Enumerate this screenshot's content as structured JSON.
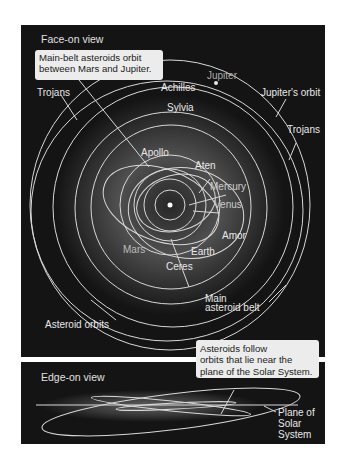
{
  "face_on": {
    "title": "Face-on view",
    "callout": [
      "Main-belt asteroids orbit",
      "between Mars and Jupiter."
    ],
    "labels": {
      "jupiter": "Jupiter",
      "achilles": "Achilles",
      "trojans_left": "Trojans",
      "jupiters_orbit": "Jupiter's orbit",
      "sylvia": "Sylvia",
      "trojans_right": "Trojans",
      "apollo": "Apollo",
      "aten": "Aten",
      "mercury": "Mercury",
      "venus": "Venus",
      "amor": "Amor",
      "mars": "Mars",
      "earth": "Earth",
      "ceres": "Ceres",
      "main_belt_1": "Main",
      "main_belt_2": "asteroid belt",
      "asteroid_orbits": "Asteroid orbits"
    }
  },
  "edge_on": {
    "title": "Edge-on view",
    "callout": [
      "Asteroids follow",
      "orbits that lie near the",
      "plane of the Solar System."
    ],
    "labels": {
      "plane_1": "Plane of",
      "plane_2": "Solar",
      "plane_3": "System"
    }
  },
  "colors": {
    "panel_bg": "#141414",
    "orbit_line": "#d8d8d8",
    "callout_bg": "#ececec"
  }
}
